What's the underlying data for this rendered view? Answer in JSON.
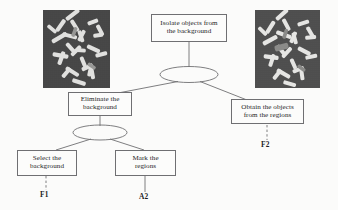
{
  "diagram": {
    "title_text": "Isolate objects from the background",
    "type": "and-or goal decomposition tree",
    "background_color": "#fbfbfa",
    "stroke_color": "#6f6f72",
    "text_color": "#262628"
  },
  "nodes": {
    "root": {
      "id": "root",
      "line1": "Isolate objects from",
      "line2": "the background"
    },
    "eliminate": {
      "id": "eliminate",
      "line1": "Eliminate the",
      "line2": "background"
    },
    "obtain": {
      "id": "obtain",
      "line1": "Obtain the objects",
      "line2": "from the regions"
    },
    "select": {
      "id": "select",
      "line1": "Select the",
      "line2": "background"
    },
    "mark": {
      "id": "mark",
      "line1": "Mark the",
      "line2": "regions"
    }
  },
  "terminals": {
    "f1": "F1",
    "a2": "A2",
    "f2": "F2"
  },
  "images": {
    "left": {
      "name": "original-rod-image",
      "background_color": "#464646",
      "object_color": "#e8e8e6"
    },
    "right": {
      "name": "segmented-rod-image",
      "background_color": "#4e4e4e",
      "object_color": "#ededeb"
    }
  },
  "connectors": {
    "and_arc_top": "ellipse-and-junction-top",
    "and_arc_lower": "ellipse-and-junction-lower",
    "dashed_f1": "dashed-link-f1",
    "dashed_f2": "dashed-link-f2",
    "solid_a2": "solid-link-a2"
  }
}
